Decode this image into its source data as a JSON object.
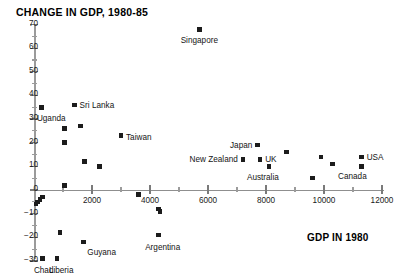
{
  "chart_data": {
    "type": "scatter",
    "title": "CHANGE IN GDP, 1980-85",
    "xlabel": "GDP IN 1980",
    "ylabel": "",
    "xlim": [
      0,
      12000
    ],
    "ylim": [
      -30,
      70
    ],
    "grid": false,
    "legend": "none",
    "x_ticks": [
      {
        "value": 2000,
        "label": "2000"
      },
      {
        "value": 4000,
        "label": "4000"
      },
      {
        "value": 6000,
        "label": "6000"
      },
      {
        "value": 8000,
        "label": "8000"
      },
      {
        "value": 10000,
        "label": "10000"
      },
      {
        "value": 12000,
        "label": "12000"
      }
    ],
    "x_minor_ticks": [
      1000,
      3000,
      5000,
      7000,
      9000,
      11000
    ],
    "y_ticks": [
      {
        "value": 70,
        "label": "70"
      },
      {
        "value": 60,
        "label": "60"
      },
      {
        "value": 50,
        "label": "50"
      },
      {
        "value": 40,
        "label": "40"
      },
      {
        "value": 30,
        "label": "30"
      },
      {
        "value": 20,
        "label": "20"
      },
      {
        "value": 10,
        "label": "10"
      },
      {
        "value": 0,
        "label": "0"
      },
      {
        "value": -10,
        "label": "−10"
      },
      {
        "value": -20,
        "label": "−20"
      },
      {
        "value": -30,
        "label": "−30"
      }
    ],
    "points": [
      {
        "x": 5700,
        "y": 68,
        "label": "Singapore",
        "anchor": "center",
        "dx": 0,
        "dy": 11
      },
      {
        "x": 1400,
        "y": 36,
        "label": "Sri Lanka",
        "anchor": "left",
        "dx": 5,
        "dy": 0
      },
      {
        "x": 250,
        "y": 35,
        "label": "Uganda",
        "anchor": "center",
        "dx": 10,
        "dy": 11
      },
      {
        "x": 3000,
        "y": 23,
        "label": "Taiwan",
        "anchor": "left",
        "dx": 5,
        "dy": 1
      },
      {
        "x": 7700,
        "y": 19,
        "label": "Japan",
        "anchor": "right",
        "dx": -5,
        "dy": 0
      },
      {
        "x": 11300,
        "y": 14,
        "label": "USA",
        "anchor": "left",
        "dx": 5,
        "dy": 0
      },
      {
        "x": 11300,
        "y": 10,
        "label": "Canada",
        "anchor": "right",
        "dx": 5,
        "dy": 10
      },
      {
        "x": 7200,
        "y": 13,
        "label": "New Zealand",
        "anchor": "right",
        "dx": -5,
        "dy": 0
      },
      {
        "x": 7800,
        "y": 13,
        "label": "UK",
        "anchor": "left",
        "dx": 5,
        "dy": 0
      },
      {
        "x": 8100,
        "y": 10,
        "label": "Australia",
        "anchor": "center",
        "dx": -6,
        "dy": 11
      },
      {
        "x": 4300,
        "y": -19,
        "label": "Argentina",
        "anchor": "center",
        "dx": 4,
        "dy": 12
      },
      {
        "x": 1700,
        "y": -22,
        "label": "Guyana",
        "anchor": "left",
        "dx": 4,
        "dy": 10
      },
      {
        "x": 300,
        "y": -29,
        "label": "Chad",
        "anchor": "center",
        "dx": 1,
        "dy": 11
      },
      {
        "x": 800,
        "y": -29,
        "label": "Liberia",
        "anchor": "center",
        "dx": 4,
        "dy": 11
      },
      {
        "x": 1050,
        "y": 26,
        "label": null
      },
      {
        "x": 1600,
        "y": 27,
        "label": null
      },
      {
        "x": 1050,
        "y": 20,
        "label": null
      },
      {
        "x": 1750,
        "y": 12,
        "label": null
      },
      {
        "x": 2250,
        "y": 10,
        "label": null
      },
      {
        "x": 1050,
        "y": 2,
        "label": null
      },
      {
        "x": 300,
        "y": -3,
        "label": null
      },
      {
        "x": 200,
        "y": -4,
        "label": null
      },
      {
        "x": 130,
        "y": -5,
        "label": null
      },
      {
        "x": 70,
        "y": -6,
        "label": null
      },
      {
        "x": 3600,
        "y": -2,
        "label": null
      },
      {
        "x": 4300,
        "y": -8,
        "label": null
      },
      {
        "x": 4350,
        "y": -9,
        "label": null
      },
      {
        "x": 900,
        "y": -18,
        "label": null
      },
      {
        "x": 8700,
        "y": 16,
        "label": null
      },
      {
        "x": 9900,
        "y": 14,
        "label": null
      },
      {
        "x": 10300,
        "y": 11,
        "label": null
      },
      {
        "x": 9600,
        "y": 5,
        "label": null
      }
    ]
  }
}
